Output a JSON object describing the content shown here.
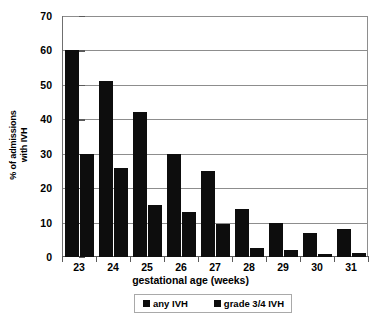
{
  "chart_data": {
    "type": "bar",
    "title": "",
    "xlabel": "gestational age (weeks)",
    "ylabel_lines": [
      "% of admissions",
      "with IVH"
    ],
    "ylabel": "% of admissions with IVH",
    "categories": [
      "23",
      "24",
      "25",
      "26",
      "27",
      "28",
      "29",
      "30",
      "31"
    ],
    "series": [
      {
        "name": "any IVH",
        "values": [
          60,
          51,
          42,
          30,
          25,
          14,
          10,
          7,
          8
        ]
      },
      {
        "name": "grade 3/4 IVH",
        "values": [
          30,
          26,
          15,
          13,
          9.5,
          2.5,
          2,
          1,
          1.2
        ]
      }
    ],
    "ylim": [
      0,
      70
    ],
    "ytick_values": [
      0,
      10,
      20,
      30,
      40,
      50,
      60,
      70
    ],
    "ytick_labels": [
      "0",
      "10",
      "20",
      "30",
      "40",
      "50",
      "60",
      "70"
    ],
    "grid": true,
    "legend_position": "bottom",
    "bar_color": "#0d0d0d",
    "gridline_color": "#8d8d8d",
    "axis_color": "#5a5a5a",
    "background": "#ffffff"
  },
  "legend": {
    "entries": [
      {
        "label": "any IVH"
      },
      {
        "label": "grade 3/4 IVH"
      }
    ]
  }
}
